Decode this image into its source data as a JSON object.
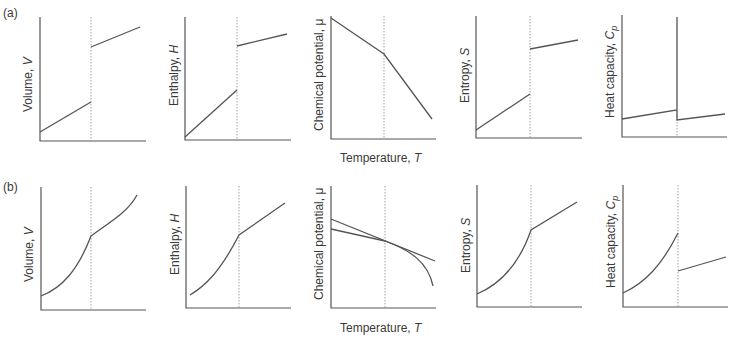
{
  "figure": {
    "rows": [
      {
        "label": "(a)",
        "description": "First-order phase transition",
        "panels": [
          {
            "ylabel": "Volume, ",
            "ysym": "V",
            "sub": ""
          },
          {
            "ylabel": "Enthalpy, ",
            "ysym": "H",
            "sub": ""
          },
          {
            "ylabel": "Chemical potential, ",
            "ysym": "μ",
            "sub": ""
          },
          {
            "ylabel": "Entropy, ",
            "ysym": "S",
            "sub": ""
          },
          {
            "ylabel": "Heat capacity, ",
            "ysym": "C",
            "sub": "p"
          }
        ],
        "xlabel": "Temperature, ",
        "xsym": "T"
      },
      {
        "label": "(b)",
        "description": "Second-order phase transition",
        "panels": [
          {
            "ylabel": "Volume, ",
            "ysym": "V",
            "sub": ""
          },
          {
            "ylabel": "Enthalpy, ",
            "ysym": "H",
            "sub": ""
          },
          {
            "ylabel": "Chemical potential, ",
            "ysym": "μ",
            "sub": ""
          },
          {
            "ylabel": "Entropy, ",
            "ysym": "S",
            "sub": ""
          },
          {
            "ylabel": "Heat capacity, ",
            "ysym": "C",
            "sub": "p"
          }
        ],
        "xlabel": "Temperature, ",
        "xsym": "T"
      }
    ],
    "colors": {
      "line": "#555555",
      "dotted": "#999999",
      "text": "#3a3a3a"
    }
  }
}
